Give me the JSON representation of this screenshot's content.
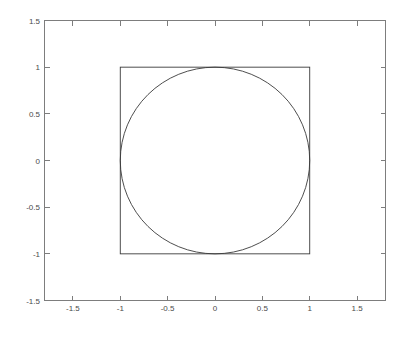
{
  "chart_data": {
    "type": "line",
    "title": "",
    "xlabel": "",
    "ylabel": "",
    "xlim": [
      -1.8,
      1.8
    ],
    "ylim": [
      -1.5,
      1.5
    ],
    "grid": false,
    "legend": null,
    "box": true,
    "xticks": [
      -1.5,
      -1,
      -0.5,
      0,
      0.5,
      1,
      1.5
    ],
    "xticklabels": [
      "-1.5",
      "-1",
      "-0.5",
      "0",
      "0.5",
      "1",
      "1.5"
    ],
    "yticks": [
      -1.5,
      -1,
      -0.5,
      0,
      0.5,
      1,
      1.5
    ],
    "yticklabels": [
      "-1.5",
      "-1",
      "-0.5",
      "0",
      "0.5",
      "1",
      "1.5"
    ],
    "series": [
      {
        "name": "square",
        "shape": "rectangle",
        "x": [
          -1,
          1,
          1,
          -1,
          -1
        ],
        "y": [
          -1,
          -1,
          1,
          1,
          -1
        ],
        "color": "#3a3a3a"
      },
      {
        "name": "circle",
        "shape": "circle",
        "center": [
          0,
          0
        ],
        "radius": 1,
        "color": "#3a3a3a"
      }
    ]
  },
  "axes": {
    "line_color": "#7d7d7d",
    "label_color": "#4a4a4a",
    "background": "#ffffff"
  }
}
